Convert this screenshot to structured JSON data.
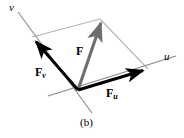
{
  "figure": {
    "caption": "(b)",
    "background_color": "#ffffff"
  },
  "axes": [
    {
      "id": "u",
      "label": "u",
      "color": "#8a8a8a",
      "label_x": 164,
      "label_y": 51,
      "start": [
        48,
        96
      ],
      "end": [
        176,
        56
      ]
    },
    {
      "id": "v",
      "label": "v",
      "color": "#8a8a8a",
      "label_x": 9,
      "label_y": 2,
      "start": [
        18,
        12
      ],
      "end": [
        92,
        113
      ]
    }
  ],
  "vectors": [
    {
      "id": "F",
      "label": "F",
      "subscript": "",
      "color": "#6e6e6e",
      "origin": [
        78,
        90
      ],
      "tip": [
        100,
        19
      ],
      "label_x": 76,
      "label_y": 45
    },
    {
      "id": "Fv",
      "label": "F",
      "subscript": "v",
      "color": "#000000",
      "origin": [
        78,
        90
      ],
      "tip": [
        32,
        37
      ],
      "label_x": 35,
      "label_y": 66
    },
    {
      "id": "Fu",
      "label": "F",
      "subscript": "u",
      "color": "#000000",
      "origin": [
        78,
        90
      ],
      "tip": [
        148,
        69
      ],
      "label_x": 106,
      "label_y": 87
    }
  ],
  "construction_lines": [
    {
      "id": "parallel-to-u",
      "color": "#b5b5b5",
      "start": [
        32,
        37
      ],
      "end": [
        100,
        19
      ]
    },
    {
      "id": "parallel-to-v",
      "color": "#b5b5b5",
      "start": [
        100,
        19
      ],
      "end": [
        148,
        69
      ]
    }
  ],
  "colors": {
    "axis_gray": "#8a8a8a",
    "construction_gray": "#b5b5b5",
    "resultant_gray": "#6e6e6e",
    "component_black": "#000000",
    "text_black": "#000000"
  }
}
